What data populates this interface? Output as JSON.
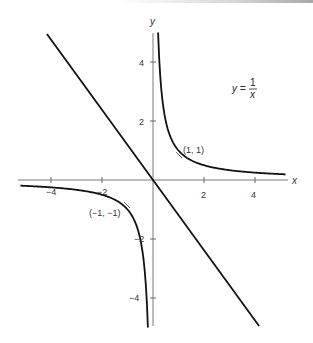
{
  "chart_data": {
    "type": "line",
    "title": "",
    "xlabel": "x",
    "ylabel": "y",
    "xlim": [
      -5.3,
      5.3
    ],
    "ylim": [
      -5,
      5
    ],
    "grid": false,
    "x_ticks": [
      -4,
      -2,
      2,
      4
    ],
    "y_ticks": [
      4,
      2,
      -2,
      -4
    ],
    "x_tick_labels": [
      "-4",
      "−2",
      "2",
      "4"
    ],
    "y_tick_labels": [
      "4",
      "2",
      "−2",
      "−4"
    ],
    "series": [
      {
        "name": "y = 1/x (right branch)",
        "x": [
          0.2,
          0.25,
          0.33,
          0.5,
          0.75,
          1,
          1.5,
          2,
          3,
          4,
          5.2
        ],
        "y": [
          5,
          4,
          3,
          2,
          1.33,
          1,
          0.67,
          0.5,
          0.33,
          0.25,
          0.19
        ]
      },
      {
        "name": "y = 1/x (left branch)",
        "x": [
          -5.2,
          -4,
          -3,
          -2,
          -1.5,
          -1,
          -0.75,
          -0.5,
          -0.33,
          -0.25,
          -0.2
        ],
        "y": [
          -0.19,
          -0.25,
          -0.33,
          -0.5,
          -0.67,
          -1,
          -1.33,
          -2,
          -3,
          -4,
          -5
        ]
      },
      {
        "name": "line through origin",
        "x": [
          -4.16,
          4.16
        ],
        "y": [
          4.95,
          -4.95
        ]
      }
    ],
    "annotations": [
      {
        "text": "(1, 1)",
        "x": 1,
        "y": 1
      },
      {
        "text": "(−1, −1)",
        "x": -1,
        "y": -1
      },
      {
        "text": "y = 1/x",
        "x": 3.5,
        "y": 3.3
      }
    ]
  },
  "labels": {
    "x_axis": "x",
    "y_axis": "y",
    "eq_lhs": "y =",
    "eq_num": "1",
    "eq_den": "x",
    "point_pos": "(1, 1)",
    "point_neg": "(−1, −1)",
    "tick_x_m4": "−4",
    "tick_x_m2": "−2",
    "tick_x_2": "2",
    "tick_x_4": "4",
    "tick_y_4": "4",
    "tick_y_2": "2",
    "tick_y_m2": "−2",
    "tick_y_m4": "−4"
  },
  "colors": {
    "curve": "#111111",
    "axis": "#7a7a7a",
    "text": "#333333"
  }
}
